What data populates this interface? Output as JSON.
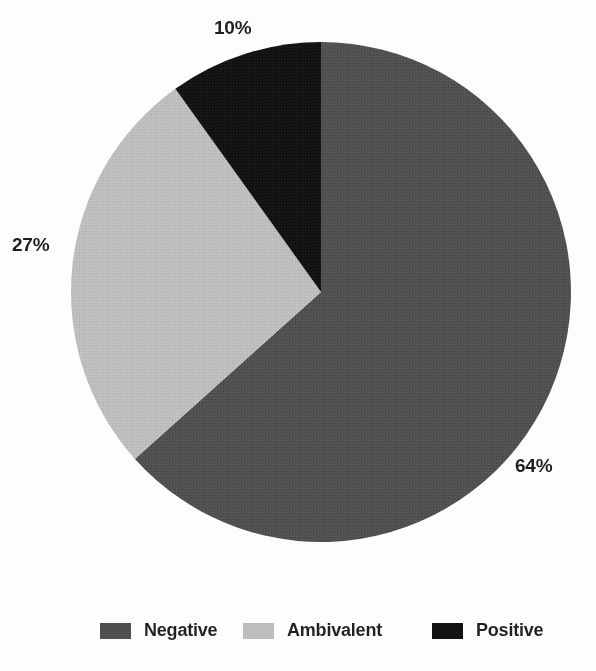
{
  "chart_data": {
    "type": "pie",
    "title": "",
    "subtitle": "",
    "xlabel": "",
    "ylabel": "",
    "grid": false,
    "legend_position": "bottom",
    "start_angle_deg": 0,
    "direction": "clockwise",
    "categories": [
      "Negative",
      "Ambivalent",
      "Positive"
    ],
    "values": [
      64,
      27,
      10
    ],
    "value_suffix": "%",
    "slices": [
      {
        "label": "Negative",
        "value": 64,
        "display": "64%",
        "color": "#4a4a4a"
      },
      {
        "label": "Ambivalent",
        "value": 27,
        "display": "27%",
        "color": "#b8b8b8"
      },
      {
        "label": "Positive",
        "value": 10,
        "display": "10%",
        "color": "#111111"
      }
    ],
    "annotations": [
      "64%",
      "27%",
      "10%"
    ]
  },
  "labels": {
    "negative_pct": "64%",
    "ambivalent_pct": "27%",
    "positive_pct": "10%"
  },
  "legend": {
    "items": [
      {
        "label": "Negative",
        "color": "#4a4a4a"
      },
      {
        "label": "Ambivalent",
        "color": "#b8b8b8"
      },
      {
        "label": "Positive",
        "color": "#111111"
      }
    ]
  },
  "colors": {
    "negative": "#4a4a4a",
    "ambivalent": "#b8b8b8",
    "positive": "#111111",
    "background": "#fdfdfd",
    "text": "#1c1c1c"
  }
}
